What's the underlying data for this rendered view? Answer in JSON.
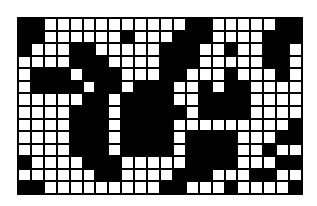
{
  "figure": {
    "cols": 22,
    "rows": 14,
    "colors": {
      "filled": "#000000",
      "empty": "#ffffff",
      "gridline": "#000000"
    },
    "cells": [
      [
        1,
        1,
        0,
        0,
        0,
        0,
        0,
        0,
        0,
        0,
        0,
        0,
        0,
        1,
        1,
        0,
        0,
        0,
        0,
        0,
        1,
        1
      ],
      [
        1,
        1,
        0,
        0,
        0,
        0,
        0,
        0,
        1,
        0,
        0,
        0,
        1,
        1,
        1,
        0,
        0,
        0,
        0,
        1,
        1,
        1
      ],
      [
        1,
        0,
        0,
        0,
        1,
        1,
        0,
        0,
        0,
        0,
        0,
        1,
        1,
        1,
        0,
        0,
        1,
        0,
        0,
        1,
        1,
        0
      ],
      [
        0,
        0,
        0,
        0,
        1,
        1,
        1,
        0,
        0,
        0,
        0,
        1,
        1,
        1,
        0,
        0,
        0,
        0,
        0,
        1,
        1,
        0
      ],
      [
        0,
        1,
        1,
        1,
        0,
        1,
        1,
        1,
        0,
        0,
        0,
        1,
        1,
        0,
        0,
        0,
        1,
        0,
        0,
        0,
        1,
        0
      ],
      [
        0,
        1,
        1,
        1,
        1,
        0,
        1,
        1,
        0,
        1,
        1,
        1,
        0,
        0,
        1,
        0,
        1,
        1,
        0,
        0,
        0,
        0
      ],
      [
        0,
        0,
        0,
        0,
        0,
        1,
        1,
        0,
        1,
        1,
        1,
        1,
        0,
        0,
        1,
        1,
        1,
        1,
        0,
        0,
        0,
        0
      ],
      [
        0,
        0,
        0,
        0,
        1,
        1,
        1,
        0,
        1,
        1,
        1,
        1,
        1,
        0,
        1,
        1,
        1,
        1,
        0,
        0,
        0,
        0
      ],
      [
        0,
        0,
        0,
        0,
        1,
        1,
        1,
        0,
        1,
        1,
        1,
        1,
        0,
        0,
        0,
        0,
        0,
        0,
        0,
        0,
        0,
        1
      ],
      [
        0,
        0,
        0,
        0,
        1,
        1,
        1,
        0,
        1,
        1,
        1,
        1,
        0,
        1,
        1,
        1,
        1,
        0,
        0,
        0,
        1,
        1
      ],
      [
        0,
        0,
        0,
        0,
        1,
        1,
        1,
        0,
        1,
        1,
        1,
        1,
        0,
        1,
        1,
        1,
        1,
        0,
        0,
        1,
        0,
        0
      ],
      [
        1,
        0,
        0,
        0,
        0,
        1,
        1,
        1,
        0,
        0,
        0,
        0,
        0,
        1,
        1,
        1,
        1,
        0,
        0,
        0,
        1,
        1
      ],
      [
        0,
        0,
        0,
        0,
        0,
        0,
        1,
        1,
        0,
        0,
        0,
        0,
        1,
        1,
        1,
        0,
        0,
        0,
        1,
        1,
        0,
        0
      ],
      [
        1,
        1,
        0,
        0,
        0,
        0,
        0,
        0,
        0,
        0,
        0,
        1,
        1,
        0,
        0,
        0,
        1,
        0,
        0,
        0,
        0,
        1
      ]
    ]
  }
}
